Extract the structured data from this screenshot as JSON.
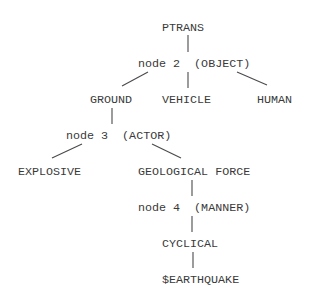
{
  "diagram": {
    "type": "tree",
    "nodes": {
      "ptrans": {
        "label": "PTRANS",
        "x": 162,
        "y": 28
      },
      "node2": {
        "label": "node 2  (OBJECT)",
        "x": 138,
        "y": 64
      },
      "ground": {
        "label": "GROUND",
        "x": 90,
        "y": 100
      },
      "vehicle": {
        "label": "VEHICLE",
        "x": 162,
        "y": 100
      },
      "human": {
        "label": "HUMAN",
        "x": 257,
        "y": 100
      },
      "node3": {
        "label": "node 3  (ACTOR)",
        "x": 66,
        "y": 136
      },
      "explosive": {
        "label": "EXPLOSIVE",
        "x": 18,
        "y": 172
      },
      "geological_force": {
        "label": "GEOLOGICAL FORCE",
        "x": 138,
        "y": 172
      },
      "node4": {
        "label": "node 4  (MANNER)",
        "x": 138,
        "y": 208
      },
      "cyclical": {
        "label": "CYCLICAL",
        "x": 162,
        "y": 244
      },
      "earthquake": {
        "label": "$EARTHQUAKE",
        "x": 162,
        "y": 280
      }
    },
    "edges": [
      {
        "from": "ptrans",
        "to": "node2",
        "x1": 188,
        "y1": 35,
        "x2": 188,
        "y2": 52
      },
      {
        "from": "node2",
        "to": "ground",
        "x1": 148,
        "y1": 72,
        "x2": 122,
        "y2": 86
      },
      {
        "from": "node2",
        "to": "vehicle",
        "x1": 188,
        "y1": 72,
        "x2": 188,
        "y2": 88
      },
      {
        "from": "node2",
        "to": "human",
        "x1": 237,
        "y1": 72,
        "x2": 267,
        "y2": 85
      },
      {
        "from": "ground",
        "to": "node3",
        "x1": 112,
        "y1": 108,
        "x2": 112,
        "y2": 124
      },
      {
        "from": "node3",
        "to": "explosive",
        "x1": 82,
        "y1": 144,
        "x2": 52,
        "y2": 158
      },
      {
        "from": "node3",
        "to": "geological_force",
        "x1": 152,
        "y1": 144,
        "x2": 181,
        "y2": 158
      },
      {
        "from": "geological_force",
        "to": "node4",
        "x1": 192,
        "y1": 180,
        "x2": 192,
        "y2": 196
      },
      {
        "from": "node4",
        "to": "cyclical",
        "x1": 192,
        "y1": 216,
        "x2": 192,
        "y2": 232
      },
      {
        "from": "cyclical",
        "to": "earthquake",
        "x1": 193,
        "y1": 252,
        "x2": 193,
        "y2": 268
      }
    ]
  }
}
